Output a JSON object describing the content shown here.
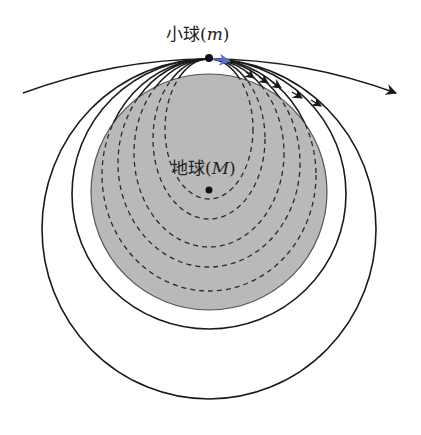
{
  "diagram": {
    "type": "orbital-trajectories",
    "labels": {
      "ball": {
        "name": "小球",
        "symbol": "m",
        "open": "(",
        "close": ")"
      },
      "earth": {
        "name": "地球",
        "symbol": "M",
        "open": "(",
        "close": ")"
      }
    },
    "colors": {
      "earth_fill": "#b9b9b9",
      "earth_stroke": "#555555",
      "orbit_stroke": "#1a1a1a",
      "velocity_arrow": "#5a6fd0",
      "background": "#ffffff"
    },
    "ball_position": [
      209,
      59
    ],
    "earth": {
      "cx": 209,
      "cy": 192,
      "r": 118
    },
    "dashed_orbits": [
      {
        "a": 44,
        "b": 70
      },
      {
        "a": 56,
        "b": 80
      },
      {
        "a": 75,
        "b": 94
      },
      {
        "a": 91,
        "b": 104
      },
      {
        "a": 107,
        "b": 116
      }
    ],
    "solid_orbits": [
      {
        "a": 137,
        "b": 135
      },
      {
        "a": 167,
        "b": 170
      }
    ],
    "escape_trajectory": "hyperbola with arrow to the right"
  }
}
